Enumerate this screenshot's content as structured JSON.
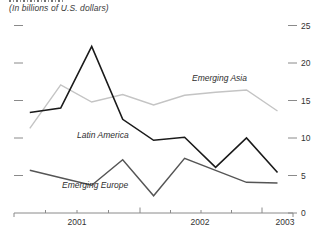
{
  "subtitle": "(In billions of U.S. dollars)",
  "chart_data": {
    "type": "line",
    "title_note": "(In billions of U.S. dollars)",
    "categories": [
      "2001Q1",
      "2001Q2",
      "2001Q3",
      "2001Q4",
      "2002Q1",
      "2002Q2",
      "2002Q3",
      "2002Q4",
      "2003Q1"
    ],
    "x_axis_labels": [
      "2001",
      "2002",
      "2003"
    ],
    "y_axis_ticks_right": [
      25,
      20,
      15,
      10,
      5,
      0
    ],
    "ylim": [
      0,
      26
    ],
    "grid": false,
    "legend_position": "inline-labels",
    "series": [
      {
        "name": "Emerging Asia",
        "color": "#c4c4c4",
        "values": [
          11.3,
          17.1,
          14.8,
          15.8,
          14.4,
          15.7,
          16.1,
          16.4,
          13.6
        ]
      },
      {
        "name": "Latin America",
        "color": "#1a1a1a",
        "values": [
          13.4,
          14.0,
          22.2,
          12.5,
          9.7,
          10.1,
          6.1,
          10.0,
          5.4
        ]
      },
      {
        "name": "Emerging Europe",
        "color": "#555555",
        "values": [
          5.7,
          4.7,
          3.7,
          7.1,
          2.3,
          7.3,
          5.7,
          4.1,
          4.0
        ]
      }
    ]
  }
}
